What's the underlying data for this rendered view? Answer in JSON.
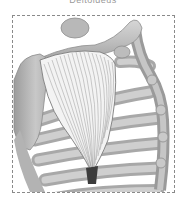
{
  "figure": {
    "title": "Deltoideus",
    "colors": {
      "muscle_lines": "#8c8c8c",
      "bone": "#bdbdbd",
      "bone_shadow": "#8f8f8f",
      "frame": "#8a8a8a",
      "tendon": "#3c3c3c"
    }
  }
}
